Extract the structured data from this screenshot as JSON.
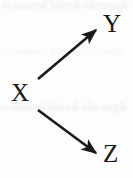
{
  "figure": {
    "type": "directed-graph",
    "background_color": "#fdfdfd",
    "ink_color": "#1a1a1a"
  },
  "nodes": [
    {
      "id": "X",
      "label": "X",
      "x": 22,
      "y": 92
    },
    {
      "id": "Y",
      "label": "Y",
      "x": 112,
      "y": 23
    },
    {
      "id": "Z",
      "label": "Z",
      "x": 112,
      "y": 153
    }
  ],
  "edges": [
    {
      "id": "x-to-y",
      "from": "X",
      "to": "Y",
      "arrowhead": "filled-triangle",
      "x1": 38,
      "y1": 79,
      "x2": 99,
      "y2": 27
    },
    {
      "id": "x-to-z",
      "from": "X",
      "to": "Z",
      "arrowhead": "filled-triangle",
      "x1": 38,
      "y1": 110,
      "x2": 100,
      "y2": 156
    }
  ],
  "artifacts": {
    "ghost_top": "scanned bleed-through",
    "ghost_mid": "scanned bleed-through",
    "ghost_low": "scanned bleed-through"
  }
}
